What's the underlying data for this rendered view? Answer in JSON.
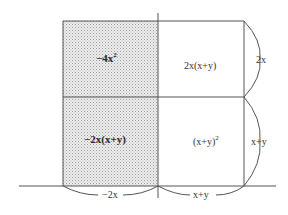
{
  "diagram": {
    "colors": {
      "shaded_fill": "#d9d9d9",
      "line": "#555555",
      "text": "#333333",
      "background": "#ffffff"
    },
    "cells": {
      "top_left": {
        "label": "−4x",
        "sup": "2",
        "shaded": true,
        "bold": true
      },
      "top_right": {
        "label": "2x(x+y)",
        "shaded": false,
        "bold": false
      },
      "bottom_left": {
        "label": "−2x(x+y)",
        "shaded": true,
        "bold": true
      },
      "bottom_right": {
        "label": "(x+y)",
        "sup": "2",
        "shaded": false,
        "bold": false
      }
    },
    "dimensions": {
      "bottom_left": "−2x",
      "bottom_right": "x+y",
      "right_top": "2x",
      "right_bottom": "x+y"
    }
  }
}
